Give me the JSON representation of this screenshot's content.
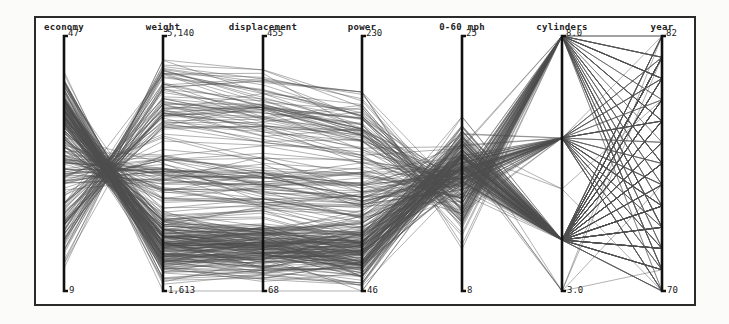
{
  "chart_data": {
    "type": "parallel_coordinates",
    "title": "",
    "dimensions": [
      {
        "name": "economy",
        "max_label": "47",
        "min_label": "9",
        "range": [
          9,
          47
        ]
      },
      {
        "name": "weight",
        "max_label": "5,140",
        "min_label": "1,613",
        "range": [
          1613,
          5140
        ]
      },
      {
        "name": "displacement",
        "max_label": "455",
        "min_label": "68",
        "range": [
          68,
          455
        ]
      },
      {
        "name": "power",
        "max_label": "230",
        "min_label": "46",
        "range": [
          46,
          230
        ]
      },
      {
        "name": "0-60 mph",
        "max_label": "25",
        "min_label": "8",
        "range": [
          8,
          25
        ]
      },
      {
        "name": "cylinders",
        "max_label": "8.0",
        "min_label": "3.0",
        "range": [
          3,
          8
        ]
      },
      {
        "name": "year",
        "max_label": "82",
        "min_label": "70",
        "range": [
          70,
          82
        ]
      }
    ],
    "line_color": "#555555",
    "grid": false,
    "legend": "none"
  },
  "colors": {
    "frame": "#2a2a2a",
    "axis": "#111111",
    "lines": "#4d4d4d",
    "background": "#ffffff"
  }
}
